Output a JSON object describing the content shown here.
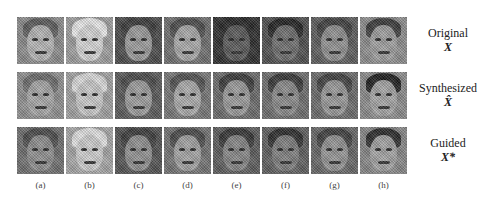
{
  "figure": {
    "columns": [
      "(a)",
      "(b)",
      "(c)",
      "(d)",
      "(e)",
      "(f)",
      "(g)",
      "(h)"
    ],
    "rows": [
      {
        "label": "Original",
        "symbol": "X"
      },
      {
        "label": "Synthesized",
        "symbol": "X̂"
      },
      {
        "label": "Guided",
        "symbol": "X*"
      }
    ],
    "tiles": [
      [
        {
          "bg": "#8a8a8a",
          "face": "#b4b4b4",
          "hair": "#5a5a5a"
        },
        {
          "bg": "#9c9c9c",
          "face": "#d4d4d4",
          "hair": "#e6e6e6"
        },
        {
          "bg": "#4a4a4a",
          "face": "#9a9a9a",
          "hair": "#3a3a3a"
        },
        {
          "bg": "#6e6e6e",
          "face": "#a8a8a8",
          "hair": "#4a4a4a"
        },
        {
          "bg": "#2e2e2e",
          "face": "#5a5a5a",
          "hair": "#262626"
        },
        {
          "bg": "#4e4e4e",
          "face": "#6e6e6e",
          "hair": "#222222"
        },
        {
          "bg": "#5c5c5c",
          "face": "#909090",
          "hair": "#3e3e3e"
        },
        {
          "bg": "#8c8c8c",
          "face": "#9e9e9e",
          "hair": "#3a3a3a"
        }
      ],
      [
        {
          "bg": "#8e8e8e",
          "face": "#a6a6a6",
          "hair": "#6a6a6a"
        },
        {
          "bg": "#a0a0a0",
          "face": "#c8c8c8",
          "hair": "#d8d8d8"
        },
        {
          "bg": "#5a5a5a",
          "face": "#9c9c9c",
          "hair": "#4a4a4a"
        },
        {
          "bg": "#767676",
          "face": "#aaaaaa",
          "hair": "#505050"
        },
        {
          "bg": "#6a6a6a",
          "face": "#9a9a9a",
          "hair": "#3a3a3a"
        },
        {
          "bg": "#6c6c6c",
          "face": "#8a8a8a",
          "hair": "#363636"
        },
        {
          "bg": "#6a6a6a",
          "face": "#989898",
          "hair": "#404040"
        },
        {
          "bg": "#8a8a8a",
          "face": "#a4a4a4",
          "hair": "#1e1e1e"
        }
      ],
      [
        {
          "bg": "#6e6e6e",
          "face": "#8e8e8e",
          "hair": "#4a4a4a"
        },
        {
          "bg": "#a4a4a4",
          "face": "#cccccc",
          "hair": "#dedede"
        },
        {
          "bg": "#525252",
          "face": "#909090",
          "hair": "#3c3c3c"
        },
        {
          "bg": "#727272",
          "face": "#a2a2a2",
          "hair": "#484848"
        },
        {
          "bg": "#5c5c5c",
          "face": "#868686",
          "hair": "#343434"
        },
        {
          "bg": "#5e5e5e",
          "face": "#7e7e7e",
          "hair": "#2c2c2c"
        },
        {
          "bg": "#666666",
          "face": "#949494",
          "hair": "#3e3e3e"
        },
        {
          "bg": "#868686",
          "face": "#a2a2a2",
          "hair": "#2a2a2a"
        }
      ]
    ]
  }
}
